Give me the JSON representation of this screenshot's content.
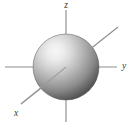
{
  "figure": {
    "background_color": "#ffffff",
    "width": 135,
    "height": 130
  },
  "chart_data": {
    "type": "diagram",
    "subtype": "3d-axes-with-sphere",
    "title": "",
    "grid": false,
    "legend": false,
    "origin": {
      "x": 66,
      "y": 67
    },
    "axes": [
      {
        "name": "z",
        "label": "z",
        "orientation": "vertical",
        "direction": "up",
        "line": {
          "x1": 66,
          "y1": 10,
          "x2": 66,
          "y2": 122
        },
        "label_position": {
          "x": 66,
          "y": 8
        },
        "color": "#8a8a8a"
      },
      {
        "name": "y",
        "label": "y",
        "orientation": "horizontal",
        "direction": "right",
        "line": {
          "x1": 5,
          "y1": 67,
          "x2": 117,
          "y2": 67
        },
        "label_position": {
          "x": 124,
          "y": 69
        },
        "color": "#8a8a8a"
      },
      {
        "name": "x",
        "label": "x",
        "orientation": "diagonal",
        "direction": "toward-viewer-lower-left",
        "line": {
          "x1": 118,
          "y1": 27,
          "x2": 21,
          "y2": 104
        },
        "label_position": {
          "x": 16,
          "y": 116
        },
        "color": "#8a8a8a"
      }
    ],
    "sphere": {
      "center": {
        "x": 66,
        "y": 67
      },
      "radius": 33,
      "shading": "radial-gradient",
      "highlight": {
        "x": 48,
        "y": 52
      },
      "color_highlight": "#f2f2f2",
      "color_mid": "#a8a8a8",
      "color_edge": "#4e4e4e",
      "color_rim": "#3c3c3c"
    },
    "annotations": [],
    "xlabel": "x",
    "ylabel": "y",
    "zlabel": "z"
  }
}
